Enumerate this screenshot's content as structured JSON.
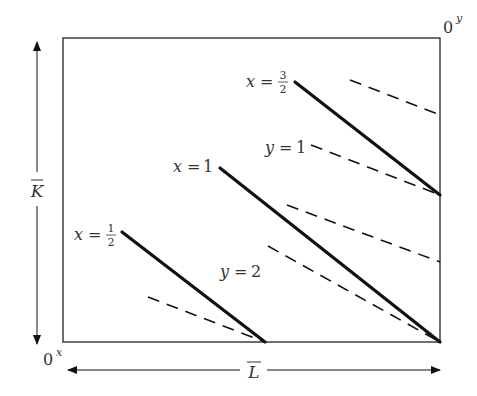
{
  "diagram": {
    "origins": {
      "bottom_left": {
        "base": "0",
        "sup": "x"
      },
      "top_right": {
        "base": "0",
        "sup": "y"
      }
    },
    "axes": {
      "vertical": {
        "label": "K",
        "overbar": true
      },
      "horizontal": {
        "label": "L",
        "overbar": true
      }
    },
    "isoquants_x": [
      {
        "label_var": "x",
        "label_eq": "=",
        "label_num": "1",
        "label_den": "2",
        "fraction": true
      },
      {
        "label_var": "x",
        "label_eq": "=",
        "label_value": "1",
        "fraction": false
      },
      {
        "label_var": "x",
        "label_eq": "=",
        "label_num": "3",
        "label_den": "2",
        "fraction": true
      }
    ],
    "isoquants_y": [
      {
        "label_var": "y",
        "label_eq": "=",
        "label_value": "1"
      },
      {
        "label_var": "y",
        "label_eq": "=",
        "label_value": "2"
      }
    ],
    "colors": {
      "line": "#111111",
      "text": "#333333",
      "background": "#ffffff"
    }
  }
}
